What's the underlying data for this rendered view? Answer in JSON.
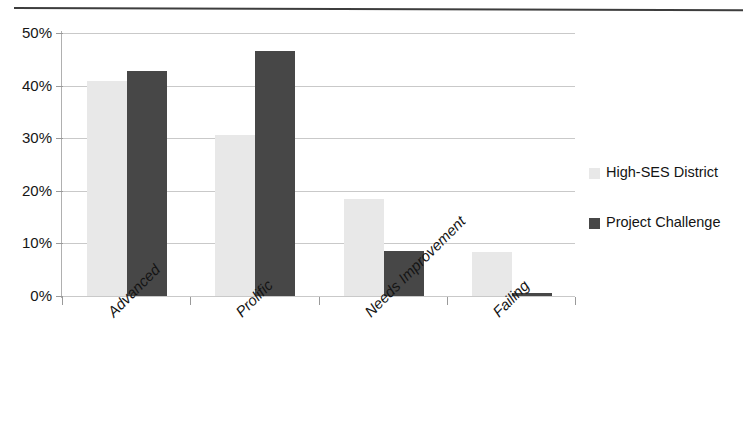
{
  "chart_data": {
    "type": "bar",
    "title": "",
    "xlabel": "",
    "ylabel": "",
    "categories": [
      "Advanced",
      "Prolific",
      "Needs Improvement",
      "Failing"
    ],
    "series": [
      {
        "name": "High-SES District",
        "color": "#e8e8e8",
        "values": [
          40.8,
          30.6,
          18.4,
          8.4
        ]
      },
      {
        "name": "Project Challenge",
        "color": "#474747",
        "values": [
          42.8,
          46.6,
          8.6,
          0.6
        ]
      }
    ],
    "ylim": [
      0,
      50
    ],
    "yticks": [
      0,
      10,
      20,
      30,
      40,
      50
    ],
    "ytick_labels": [
      "0%",
      "10%",
      "20%",
      "30%",
      "40%",
      "50%"
    ],
    "grid": "horizontal",
    "legend_position": "right",
    "value_format": "percent"
  }
}
